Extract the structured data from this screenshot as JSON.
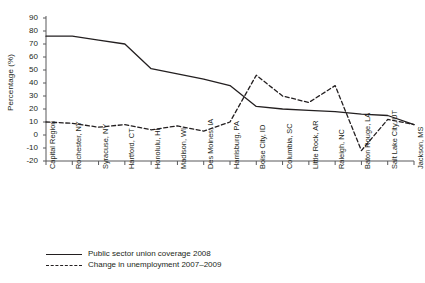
{
  "chart_data": {
    "type": "line",
    "title": "",
    "xlabel": "",
    "ylabel": "Percentage (%)",
    "ylim": [
      -20,
      90
    ],
    "yticks": [
      90,
      80,
      70,
      60,
      50,
      40,
      30,
      20,
      10,
      0,
      -10,
      -20
    ],
    "grid": false,
    "legend_position": "bottom-left",
    "categories": [
      "Capital Region",
      "Rochester, NY",
      "Syracuse, NY",
      "Hartford, CT",
      "Honolulu, HI",
      "Madison, WI",
      "Des Moines, IA",
      "Harrisburg, PA",
      "Boise City, ID",
      "Columbia, SC",
      "Little Rock, AR",
      "Raleigh, NC",
      "Baton Rouge, LA",
      "Salt Lake City, UT",
      "Jackson, MS"
    ],
    "series": [
      {
        "name": "Public sector union coverage 2008",
        "style": "solid",
        "color": "#231f20",
        "values": [
          76,
          76,
          73,
          70,
          51,
          47,
          43,
          38,
          22,
          20,
          19,
          18,
          16,
          15,
          8
        ]
      },
      {
        "name": "Change in unemployment 2007-2009",
        "style": "dashed",
        "color": "#231f20",
        "values": [
          10,
          9,
          6,
          8,
          4,
          7,
          3,
          10,
          46,
          30,
          25,
          38,
          -12,
          12,
          8
        ]
      }
    ]
  },
  "legend": {
    "items": [
      {
        "label": "Public sector union coverage 2008",
        "style": "solid"
      },
      {
        "label": "Change in unemployment 2007–2009",
        "style": "dashed"
      }
    ]
  }
}
